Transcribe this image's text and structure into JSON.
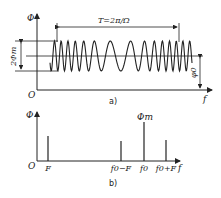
{
  "figure_a": {
    "y_axis_label": "Φ",
    "origin_label": "O",
    "x_axis_label": "f",
    "period_label": "T=2π/Ω",
    "amplitude_label": "2Φm",
    "offset_label": "φ0",
    "caption": "a)"
  },
  "figure_b": {
    "y_axis_label": "Φ",
    "origin_label": "O",
    "x_axis_label": "f",
    "peak_label": "Φm",
    "caption": "b)",
    "lines": [
      {
        "label": "F",
        "x": 48,
        "top": 136
      },
      {
        "label": "f0−F",
        "x": 121,
        "top": 141
      },
      {
        "label": "f0",
        "x": 144,
        "top": 122
      },
      {
        "label": "f0+F",
        "x": 166,
        "top": 140
      }
    ]
  },
  "colors": {
    "stroke": "#222222",
    "background": "#ffffff"
  }
}
